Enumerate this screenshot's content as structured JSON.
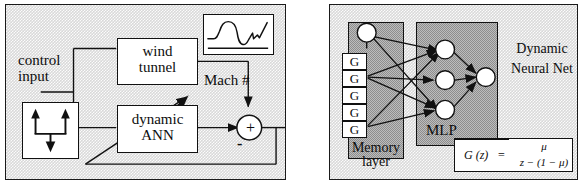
{
  "figure": {
    "panels": [
      {
        "id": "control-system-block-diagram",
        "labels": {
          "control_input": "control\ninput",
          "wind_tunnel": "wind\ntunnel",
          "dynamic_ann": "dynamic\nANN",
          "mach": "Mach #",
          "sum_plus": "+",
          "sum_minus": "-"
        },
        "blocks": [
          "control input source",
          "wind tunnel",
          "dynamic ANN",
          "Mach # response plot",
          "summing junction"
        ]
      },
      {
        "id": "dynamic-neural-net",
        "labels": {
          "memory_layer": "Memory\nlayer",
          "mlp": "MLP",
          "dynamic_neural_net": "Dynamic\nNeural Net"
        },
        "memory_units": [
          "G",
          "G",
          "G",
          "G",
          "G"
        ],
        "mlp": {
          "hidden_nodes": 3,
          "output_nodes": 1
        },
        "formula": {
          "lhs": "G (z)",
          "equals": "=",
          "numerator": "μ",
          "denominator": "z − (1 − μ)",
          "plain": "G(z) = μ / (z − (1 − μ))"
        }
      }
    ],
    "colors": {
      "background_light_gray": "#d9d9d9",
      "region_dark_gray": "#8d8d8d",
      "line": "#111111",
      "box_fill": "#ffffff"
    }
  }
}
